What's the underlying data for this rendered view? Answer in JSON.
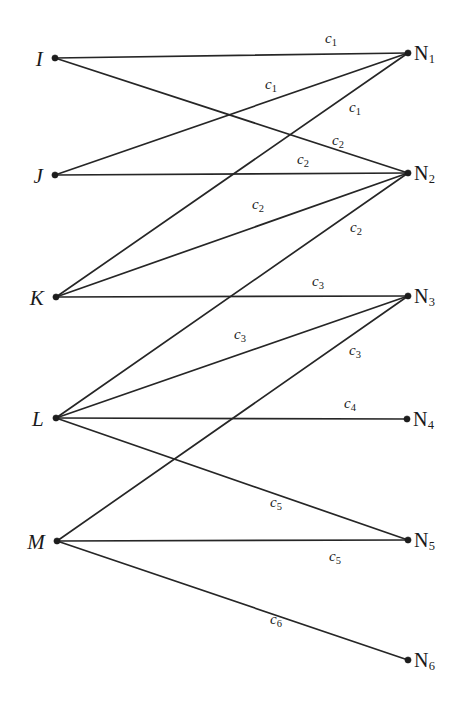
{
  "figure": {
    "background_color": "#ffffff",
    "line_color": "#262626",
    "text_color": "#1a1a1a",
    "width": 458,
    "height": 709
  },
  "left_nodes": [
    {
      "id": "I",
      "label": "I",
      "x": 55,
      "y": 58
    },
    {
      "id": "J",
      "label": "J",
      "x": 55,
      "y": 175
    },
    {
      "id": "K",
      "label": "K",
      "x": 56,
      "y": 297
    },
    {
      "id": "L",
      "label": "L",
      "x": 56,
      "y": 418
    },
    {
      "id": "M",
      "label": "M",
      "x": 57,
      "y": 541
    }
  ],
  "right_nodes": [
    {
      "id": "N1",
      "label": "N",
      "sub": "1",
      "x": 408,
      "y": 53
    },
    {
      "id": "N2",
      "label": "N",
      "sub": "2",
      "x": 408,
      "y": 173
    },
    {
      "id": "N3",
      "label": "N",
      "sub": "3",
      "x": 408,
      "y": 296
    },
    {
      "id": "N4",
      "label": "N",
      "sub": "4",
      "x": 407,
      "y": 419
    },
    {
      "id": "N5",
      "label": "N",
      "sub": "5",
      "x": 408,
      "y": 540
    },
    {
      "id": "N6",
      "label": "N",
      "sub": "6",
      "x": 408,
      "y": 660
    }
  ],
  "edges": [
    {
      "from": "I",
      "to": "N1",
      "label": "c",
      "sub": "1",
      "x1": 55,
      "y1": 58,
      "x2": 408,
      "y2": 53,
      "lx": 331,
      "ly": 39
    },
    {
      "from": "I",
      "to": "N2",
      "label": "c",
      "sub": "2",
      "x1": 55,
      "y1": 58,
      "x2": 408,
      "y2": 173,
      "lx": 338,
      "ly": 141
    },
    {
      "from": "J",
      "to": "N1",
      "label": "c",
      "sub": "1",
      "x1": 55,
      "y1": 175,
      "x2": 408,
      "y2": 53,
      "lx": 271,
      "ly": 85
    },
    {
      "from": "J",
      "to": "N2",
      "label": "c",
      "sub": "2",
      "x1": 55,
      "y1": 175,
      "x2": 408,
      "y2": 173,
      "lx": 303,
      "ly": 160
    },
    {
      "from": "K",
      "to": "N1",
      "label": "c",
      "sub": "1",
      "x1": 56,
      "y1": 297,
      "x2": 408,
      "y2": 53,
      "lx": 355,
      "ly": 108
    },
    {
      "from": "K",
      "to": "N2",
      "label": "c",
      "sub": "2",
      "x1": 56,
      "y1": 297,
      "x2": 408,
      "y2": 173,
      "lx": 258,
      "ly": 205
    },
    {
      "from": "K",
      "to": "N3",
      "label": "c",
      "sub": "3",
      "x1": 56,
      "y1": 297,
      "x2": 408,
      "y2": 296,
      "lx": 318,
      "ly": 282
    },
    {
      "from": "L",
      "to": "N2",
      "label": "c",
      "sub": "2",
      "x1": 56,
      "y1": 418,
      "x2": 408,
      "y2": 173,
      "lx": 356,
      "ly": 228
    },
    {
      "from": "L",
      "to": "N3",
      "label": "c",
      "sub": "3",
      "x1": 56,
      "y1": 418,
      "x2": 408,
      "y2": 296,
      "lx": 240,
      "ly": 335
    },
    {
      "from": "L",
      "to": "N4",
      "label": "c",
      "sub": "4",
      "x1": 56,
      "y1": 418,
      "x2": 407,
      "y2": 419,
      "lx": 350,
      "ly": 404
    },
    {
      "from": "L",
      "to": "N5",
      "label": "c",
      "sub": "5",
      "x1": 56,
      "y1": 418,
      "x2": 408,
      "y2": 540,
      "lx": 276,
      "ly": 503
    },
    {
      "from": "M",
      "to": "N3",
      "label": "c",
      "sub": "3",
      "x1": 57,
      "y1": 541,
      "x2": 408,
      "y2": 296,
      "lx": 355,
      "ly": 351
    },
    {
      "from": "M",
      "to": "N5",
      "label": "c",
      "sub": "5",
      "x1": 57,
      "y1": 541,
      "x2": 408,
      "y2": 540,
      "lx": 335,
      "ly": 557
    },
    {
      "from": "M",
      "to": "N6",
      "label": "c",
      "sub": "6",
      "x1": 57,
      "y1": 541,
      "x2": 408,
      "y2": 660,
      "lx": 276,
      "ly": 620
    }
  ],
  "chart_data": {
    "type": "diagram",
    "subtype": "bipartite-graph",
    "left_set": [
      "I",
      "J",
      "K",
      "L",
      "M"
    ],
    "right_set": [
      "N1",
      "N2",
      "N3",
      "N4",
      "N5",
      "N6"
    ],
    "edge_list": [
      {
        "source": "I",
        "target": "N1",
        "cost": "c1"
      },
      {
        "source": "I",
        "target": "N2",
        "cost": "c2"
      },
      {
        "source": "J",
        "target": "N1",
        "cost": "c1"
      },
      {
        "source": "J",
        "target": "N2",
        "cost": "c2"
      },
      {
        "source": "K",
        "target": "N1",
        "cost": "c1"
      },
      {
        "source": "K",
        "target": "N2",
        "cost": "c2"
      },
      {
        "source": "K",
        "target": "N3",
        "cost": "c3"
      },
      {
        "source": "L",
        "target": "N2",
        "cost": "c2"
      },
      {
        "source": "L",
        "target": "N3",
        "cost": "c3"
      },
      {
        "source": "L",
        "target": "N4",
        "cost": "c4"
      },
      {
        "source": "L",
        "target": "N5",
        "cost": "c5"
      },
      {
        "source": "M",
        "target": "N3",
        "cost": "c3"
      },
      {
        "source": "M",
        "target": "N5",
        "cost": "c5"
      },
      {
        "source": "M",
        "target": "N6",
        "cost": "c6"
      }
    ],
    "edge_count": 14,
    "cost_labels": [
      "c1",
      "c2",
      "c3",
      "c4",
      "c5",
      "c6"
    ],
    "degrees_left": {
      "I": 2,
      "J": 2,
      "K": 3,
      "L": 4,
      "M": 3
    },
    "degrees_right": {
      "N1": 3,
      "N2": 4,
      "N3": 3,
      "N4": 1,
      "N5": 2,
      "N6": 1
    }
  }
}
